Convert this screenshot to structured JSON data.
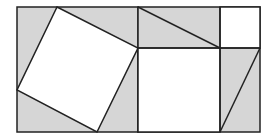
{
  "diagram": {
    "colors": {
      "shaded": "#d6d6d6",
      "unshaded": "#ffffff",
      "stroke": "#222222"
    },
    "left_square": {
      "outer": [
        17,
        7,
        138,
        132
      ],
      "inner_square_c2": [
        [
          57,
          7
        ],
        [
          138,
          48
        ],
        [
          97,
          132
        ],
        [
          17,
          90
        ]
      ]
    },
    "right_square": {
      "outer": [
        138,
        7,
        260,
        132
      ],
      "divider_x": 220,
      "divider_y": 48,
      "square_a2": [
        220,
        7,
        260,
        48
      ],
      "square_b2": [
        138,
        48,
        220,
        132
      ],
      "top_diagonal": [
        [
          138,
          7
        ],
        [
          220,
          48
        ]
      ],
      "right_diagonal": [
        [
          260,
          48
        ],
        [
          220,
          132
        ]
      ]
    }
  }
}
